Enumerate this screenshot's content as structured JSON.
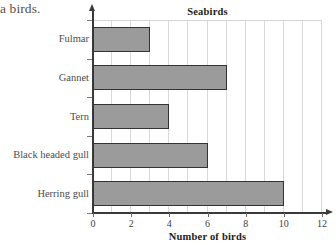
{
  "document_fragment": "a birds.",
  "chart_data": {
    "type": "bar",
    "orientation": "horizontal",
    "title": "Seabirds",
    "xlabel": "Number of birds",
    "ylabel": "",
    "categories": [
      "Fulmar",
      "Gannet",
      "Tern",
      "Black headed gull",
      "Herring gull"
    ],
    "values": [
      3,
      7,
      4,
      6,
      10
    ],
    "xlim": [
      0,
      12
    ],
    "xticks": [
      0,
      2,
      4,
      6,
      8,
      10,
      12
    ],
    "xtick_labels": [
      "0",
      "2",
      "4",
      "6",
      "8",
      "10",
      "12"
    ],
    "grid": true,
    "grid_axis": "x",
    "grid_interval": 1,
    "legend": false,
    "bar_fill_color": "#9b9b9b",
    "bar_border_color": "#333333",
    "gridline_color": "#d9d9d9",
    "axis_color": "#3a3a3a",
    "background_color": "#ffffff"
  },
  "bars": [
    {
      "label": "Fulmar",
      "value": 3
    },
    {
      "label": "Gannet",
      "value": 7
    },
    {
      "label": "Tern",
      "value": 4
    },
    {
      "label": "Black headed gull",
      "value": 6
    },
    {
      "label": "Herring gull",
      "value": 10
    }
  ],
  "xticks": [
    {
      "label": "0",
      "value": 0
    },
    {
      "label": "2",
      "value": 2
    },
    {
      "label": "4",
      "value": 4
    },
    {
      "label": "6",
      "value": 6
    },
    {
      "label": "8",
      "value": 8
    },
    {
      "label": "10",
      "value": 10
    },
    {
      "label": "12",
      "value": 12
    }
  ]
}
